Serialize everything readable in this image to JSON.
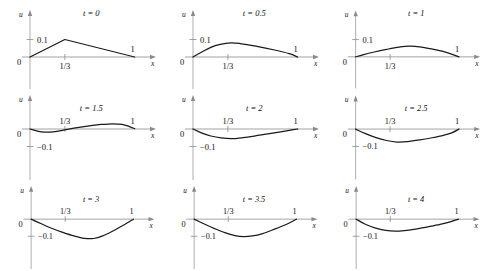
{
  "figure": {
    "axis_labels": {
      "x": "x",
      "u": "u"
    },
    "tick_labels": {
      "origin": "0",
      "third": "1/3",
      "one": "1",
      "pos_tenth": "0.1",
      "neg_tenth": "−0.1"
    },
    "curve_color": "#1a1a1a",
    "axis_color": "#8a8a8a"
  },
  "chart_data": {
    "type": "line",
    "title": "",
    "xlabel": "x",
    "ylabel": "u",
    "xlim": [
      0,
      1.08
    ],
    "ylim": [
      -0.16,
      0.145
    ],
    "grid": false,
    "legend": "none",
    "xticks": [
      0,
      0.3333,
      1
    ],
    "xticklabels": [
      "0",
      "1/3",
      "1"
    ],
    "panels": [
      {
        "label": "t = 0",
        "t": 0,
        "yticks": [
          0.1
        ],
        "yticklabels": [
          "0.1"
        ],
        "x": [
          0,
          0.3333,
          1
        ],
        "y": [
          0,
          0.1,
          0
        ]
      },
      {
        "label": "t = 0.5",
        "t": 0.5,
        "yticks": [
          0.1
        ],
        "yticklabels": [
          "0.1"
        ],
        "x": [
          0,
          0.08,
          0.17,
          0.26,
          0.36,
          0.45,
          0.6,
          0.78,
          0.92,
          1
        ],
        "y": [
          0,
          0.027,
          0.055,
          0.072,
          0.081,
          0.077,
          0.062,
          0.04,
          0.019,
          0
        ]
      },
      {
        "label": "t = 1",
        "t": 1,
        "yticks": [
          0.1
        ],
        "yticklabels": [
          "0.1"
        ],
        "x": [
          0,
          0.07,
          0.18,
          0.3,
          0.42,
          0.52,
          0.62,
          0.78,
          0.9,
          1
        ],
        "y": [
          0,
          0.012,
          0.028,
          0.043,
          0.056,
          0.062,
          0.058,
          0.04,
          0.022,
          0
        ]
      },
      {
        "label": "t = 1.5",
        "t": 1.5,
        "yticks": [
          -0.1
        ],
        "yticklabels": [
          "−0.1"
        ],
        "x": [
          0,
          0.07,
          0.14,
          0.22,
          0.31,
          0.42,
          0.55,
          0.68,
          0.79,
          0.88,
          0.95,
          1
        ],
        "y": [
          0,
          -0.012,
          -0.018,
          -0.016,
          -0.008,
          0.005,
          0.017,
          0.026,
          0.03,
          0.026,
          0.014,
          0.002
        ]
      },
      {
        "label": "t = 2",
        "t": 2,
        "yticks": [
          -0.1
        ],
        "yticklabels": [
          "−0.1"
        ],
        "x": [
          0,
          0.08,
          0.17,
          0.27,
          0.37,
          0.48,
          0.62,
          0.76,
          0.88,
          0.96,
          1
        ],
        "y": [
          0,
          -0.022,
          -0.04,
          -0.051,
          -0.055,
          -0.049,
          -0.037,
          -0.024,
          -0.012,
          -0.004,
          0
        ]
      },
      {
        "label": "t = 2.5",
        "t": 2.5,
        "yticks": [
          -0.1
        ],
        "yticklabels": [
          "−0.1"
        ],
        "x": [
          0,
          0.09,
          0.19,
          0.3,
          0.4,
          0.5,
          0.62,
          0.74,
          0.85,
          0.93,
          1
        ],
        "y": [
          0,
          -0.025,
          -0.048,
          -0.066,
          -0.075,
          -0.073,
          -0.063,
          -0.05,
          -0.036,
          -0.022,
          0
        ]
      },
      {
        "label": "t = 3",
        "t": 3,
        "yticks": [
          -0.1
        ],
        "yticklabels": [
          "−0.1"
        ],
        "x": [
          0,
          0.1,
          0.2,
          0.31,
          0.42,
          0.52,
          0.61,
          0.7,
          0.8,
          0.9,
          1
        ],
        "y": [
          0,
          -0.027,
          -0.053,
          -0.077,
          -0.098,
          -0.112,
          -0.113,
          -0.098,
          -0.069,
          -0.036,
          0
        ]
      },
      {
        "label": "t = 3.5",
        "t": 3.5,
        "yticks": [
          -0.1
        ],
        "yticklabels": [
          "−0.1"
        ],
        "x": [
          0,
          0.1,
          0.2,
          0.3,
          0.4,
          0.48,
          0.57,
          0.67,
          0.78,
          0.9,
          1
        ],
        "y": [
          0,
          -0.028,
          -0.055,
          -0.079,
          -0.096,
          -0.102,
          -0.098,
          -0.084,
          -0.06,
          -0.031,
          0
        ]
      },
      {
        "label": "t = 4",
        "t": 4,
        "yticks": [
          -0.1
        ],
        "yticklabels": [
          "−0.1"
        ],
        "x": [
          0,
          0.09,
          0.19,
          0.29,
          0.38,
          0.47,
          0.58,
          0.7,
          0.82,
          0.92,
          1
        ],
        "y": [
          0,
          -0.03,
          -0.052,
          -0.065,
          -0.07,
          -0.067,
          -0.058,
          -0.045,
          -0.031,
          -0.016,
          0
        ]
      }
    ]
  }
}
